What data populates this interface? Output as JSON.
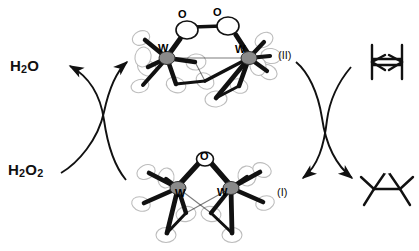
{
  "figure": {
    "type": "catalytic-cycle",
    "background_color": "#ffffff",
    "ink_color": "#111111",
    "ellipsoid_outline_color": "#b9b9b9",
    "metal_fill_color": "#8a8a8a"
  },
  "left_cycle": {
    "reagent_in": {
      "label_html": "H<sub>2</sub>O<sub>2</sub>",
      "text": "H2O2"
    },
    "product_out": {
      "label_html": "H<sub>2</sub>O",
      "text": "H2O"
    },
    "arrows": [
      {
        "name": "arrow-h2o2-to-complex",
        "from": "H2O2",
        "to": "complex-II",
        "head": "up-right"
      },
      {
        "name": "arrow-complex-to-h2o",
        "from": "complex-I",
        "to": "H2O",
        "head": "up-left"
      }
    ]
  },
  "right_cycle": {
    "substrate": {
      "name": "alkene",
      "label": "tetramethylethylene",
      "heteroatom": ""
    },
    "product": {
      "name": "epoxide",
      "label": "tetramethyloxirane",
      "heteroatom": "O"
    },
    "arrows": [
      {
        "name": "arrow-alkene-to-complex",
        "from": "alkene",
        "to": "complex-I",
        "head": "down-left"
      },
      {
        "name": "arrow-complex-to-epoxide",
        "from": "complex-II",
        "to": "epoxide",
        "head": "down-right"
      }
    ]
  },
  "structures": {
    "top": {
      "name": "complex-II",
      "tag": "(II)",
      "bridge": "mu-peroxo",
      "metal_labels": [
        "W",
        "W"
      ],
      "oxygen_labels": [
        "O",
        "O"
      ],
      "description": "di-tungsten mu-peroxo ORTEP structure"
    },
    "bottom": {
      "name": "complex-I",
      "tag": "(I)",
      "bridge": "mu-oxo",
      "metal_labels": [
        "W",
        "W"
      ],
      "oxygen_labels": [
        "O"
      ],
      "description": "di-tungsten mu-oxo ORTEP structure"
    }
  }
}
